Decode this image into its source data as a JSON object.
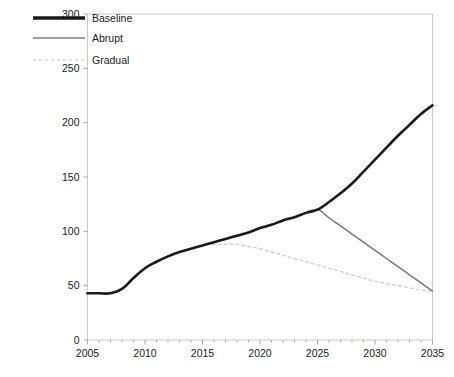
{
  "chart_data": {
    "type": "line",
    "title": "",
    "xlabel": "",
    "ylabel": "",
    "xlim": [
      2005,
      2035
    ],
    "ylim": [
      0,
      300
    ],
    "ytick_labels": [
      "0",
      "50",
      "100",
      "150",
      "200",
      "250",
      "300"
    ],
    "ytick_values": [
      0,
      50,
      100,
      150,
      200,
      250,
      300
    ],
    "xtick_labels": [
      "2005",
      "2010",
      "2015",
      "2020",
      "2025",
      "2030",
      "2035"
    ],
    "xtick_values": [
      2005,
      2010,
      2015,
      2020,
      2025,
      2030,
      2035
    ],
    "minor_xtick_step": 1,
    "grid": false,
    "legend_position": "top-left",
    "x": [
      2005,
      2006,
      2007,
      2008,
      2009,
      2010,
      2011,
      2012,
      2013,
      2014,
      2015,
      2016,
      2017,
      2018,
      2019,
      2020,
      2021,
      2022,
      2023,
      2024,
      2025,
      2026,
      2027,
      2028,
      2029,
      2030,
      2031,
      2032,
      2033,
      2034,
      2035
    ],
    "series": [
      {
        "name": "Baseline",
        "color": "#1a1a1a",
        "width": 2.6,
        "dash": "none",
        "values": [
          43,
          43,
          43,
          47,
          57,
          66,
          72,
          77,
          81,
          84,
          87,
          90,
          93,
          96,
          99,
          103,
          106,
          110,
          113,
          117,
          120,
          127,
          135,
          144,
          155,
          166,
          177,
          188,
          198,
          208,
          216
        ]
      },
      {
        "name": "Abrupt",
        "color": "#777777",
        "width": 1.5,
        "dash": "none",
        "values": [
          43,
          43,
          43,
          47,
          57,
          66,
          72,
          77,
          81,
          84,
          87,
          90,
          93,
          96,
          99,
          103,
          106,
          110,
          113,
          117,
          120,
          112.5,
          105,
          97.5,
          90,
          82.5,
          75,
          67.5,
          60,
          52.5,
          45
        ]
      },
      {
        "name": "Gradual",
        "color": "#d2d2d2",
        "width": 1.4,
        "dash": "3 3",
        "values": [
          43,
          43,
          43,
          47,
          57,
          66,
          72,
          77,
          81,
          84,
          87,
          88,
          88,
          88,
          86,
          84,
          81,
          78,
          75,
          72,
          69,
          66,
          63,
          60,
          57,
          54,
          52,
          50,
          48,
          46,
          45
        ]
      }
    ]
  },
  "legend": {
    "items": [
      {
        "label": "Baseline"
      },
      {
        "label": "Abrupt"
      },
      {
        "label": "Gradual"
      }
    ]
  },
  "axes": {
    "frame_color": "#c8c8c8",
    "tick_color": "#aaaaaa",
    "label_color": "#1a1a1a"
  }
}
